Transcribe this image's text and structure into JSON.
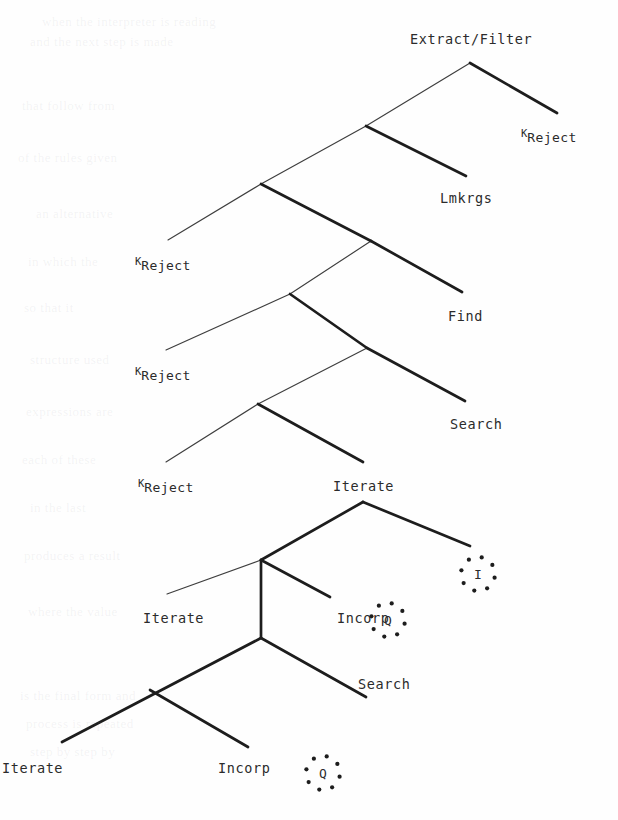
{
  "figure": {
    "type": "derivation-tree",
    "background_color": "#fefefe",
    "stroke_color": "#1d1d1d",
    "text_color": "#2b2b2b",
    "width": 618,
    "height": 820
  },
  "nodes": [
    {
      "id": "root",
      "label": "Extract/Filter",
      "x": 470,
      "y": 63,
      "label_x": 410,
      "label_y": 33
    },
    {
      "id": "n2",
      "label": "",
      "x": 366,
      "y": 126
    },
    {
      "id": "n3",
      "label": "",
      "x": 261,
      "y": 184
    },
    {
      "id": "n4",
      "label": "",
      "x": 371,
      "y": 241
    },
    {
      "id": "n5",
      "label": "",
      "x": 290,
      "y": 294
    },
    {
      "id": "n6",
      "label": "",
      "x": 367,
      "y": 348
    },
    {
      "id": "n7",
      "label": "",
      "x": 258,
      "y": 404
    },
    {
      "id": "iterate_top",
      "label": "Iterate",
      "x": 363,
      "y": 502,
      "label_x": 333,
      "label_y": 480
    },
    {
      "id": "n9",
      "label": "",
      "x": 261,
      "y": 560
    },
    {
      "id": "n10",
      "label": "",
      "x": 261,
      "y": 638
    }
  ],
  "leaves": [
    {
      "id": "leaf-reject-1",
      "label": "Reject",
      "sup": "K",
      "x": 521,
      "y": 128,
      "tip_x": 557,
      "tip_y": 113
    },
    {
      "id": "leaf-lmkrgs",
      "label": "Lmkrgs",
      "x": 440,
      "y": 192,
      "tip_x": 466,
      "tip_y": 176
    },
    {
      "id": "leaf-reject-2",
      "label": "Reject",
      "sup": "K",
      "x": 135,
      "y": 256,
      "tip_x": 168,
      "tip_y": 240
    },
    {
      "id": "leaf-find",
      "label": "Find",
      "x": 448,
      "y": 310,
      "tip_x": 462,
      "tip_y": 292
    },
    {
      "id": "leaf-reject-3",
      "label": "Reject",
      "sup": "K",
      "x": 135,
      "y": 366,
      "tip_x": 166,
      "tip_y": 350
    },
    {
      "id": "leaf-search-1",
      "label": "Search",
      "x": 450,
      "y": 418,
      "tip_x": 465,
      "tip_y": 401
    },
    {
      "id": "leaf-reject-4",
      "label": "Reject",
      "sup": "K",
      "x": 138,
      "y": 478,
      "tip_x": 166,
      "tip_y": 462
    },
    {
      "id": "leaf-iterate-2",
      "label": "Iterate",
      "x": 143,
      "y": 612,
      "tip_x": 167,
      "tip_y": 594
    },
    {
      "id": "leaf-incorp-1",
      "label": "Incorp",
      "x": 337,
      "y": 612,
      "tip_x": 330,
      "tip_y": 597
    },
    {
      "id": "leaf-search-2",
      "label": "Search",
      "x": 358,
      "y": 678,
      "tip_x": 366,
      "tip_y": 663
    },
    {
      "id": "leaf-iterate-3",
      "label": "Iterate",
      "x": 2,
      "y": 762,
      "tip_x": 62,
      "tip_y": 742
    },
    {
      "id": "leaf-incorp-2",
      "label": "Incorp",
      "x": 218,
      "y": 762,
      "tip_x": 248,
      "tip_y": 747
    }
  ],
  "circled_symbols": [
    {
      "id": "circle-i",
      "letter": "I",
      "x": 455,
      "y": 551
    },
    {
      "id": "circle-q1",
      "letter": "Q",
      "x": 365,
      "y": 597
    },
    {
      "id": "circle-q2",
      "letter": "Q",
      "x": 300,
      "y": 750
    }
  ],
  "edges": [
    {
      "from": "root",
      "to": "n2",
      "weight": "thin",
      "x1": 470,
      "y1": 63,
      "x2": 366,
      "y2": 126
    },
    {
      "from": "root",
      "to": "leaf-reject-1",
      "weight": "thick",
      "x1": 470,
      "y1": 63,
      "x2": 557,
      "y2": 113
    },
    {
      "from": "n2",
      "to": "n3",
      "weight": "thin",
      "x1": 366,
      "y1": 126,
      "x2": 261,
      "y2": 184
    },
    {
      "from": "n2",
      "to": "leaf-lmkrgs",
      "weight": "thick",
      "x1": 366,
      "y1": 126,
      "x2": 466,
      "y2": 176
    },
    {
      "from": "n3",
      "to": "leaf-reject-2",
      "weight": "thin",
      "x1": 261,
      "y1": 184,
      "x2": 168,
      "y2": 240
    },
    {
      "from": "n3",
      "to": "n4",
      "weight": "thick",
      "x1": 261,
      "y1": 184,
      "x2": 371,
      "y2": 241
    },
    {
      "from": "n4",
      "to": "n5",
      "weight": "thin",
      "x1": 371,
      "y1": 241,
      "x2": 290,
      "y2": 294
    },
    {
      "from": "n4",
      "to": "leaf-find",
      "weight": "thick",
      "x1": 371,
      "y1": 241,
      "x2": 462,
      "y2": 292
    },
    {
      "from": "n5",
      "to": "leaf-reject-3",
      "weight": "thin",
      "x1": 290,
      "y1": 294,
      "x2": 166,
      "y2": 350
    },
    {
      "from": "n5",
      "to": "n6",
      "weight": "thick",
      "x1": 290,
      "y1": 294,
      "x2": 367,
      "y2": 348
    },
    {
      "from": "n6",
      "to": "n7",
      "weight": "thin",
      "x1": 367,
      "y1": 348,
      "x2": 258,
      "y2": 404
    },
    {
      "from": "n6",
      "to": "leaf-search-1",
      "weight": "thick",
      "x1": 367,
      "y1": 348,
      "x2": 465,
      "y2": 401
    },
    {
      "from": "n7",
      "to": "leaf-reject-4",
      "weight": "thin",
      "x1": 258,
      "y1": 404,
      "x2": 166,
      "y2": 462
    },
    {
      "from": "n7",
      "to": "iterate_top",
      "weight": "thick",
      "x1": 258,
      "y1": 404,
      "x2": 363,
      "y2": 462
    },
    {
      "from": "iterate_top",
      "to": "n9",
      "weight": "thick",
      "x1": 363,
      "y1": 502,
      "x2": 261,
      "y2": 560
    },
    {
      "from": "iterate_top",
      "to": "circle-i",
      "weight": "thick",
      "x1": 363,
      "y1": 502,
      "x2": 470,
      "y2": 546
    },
    {
      "from": "n9",
      "to": "leaf-iterate-2",
      "weight": "thin",
      "x1": 261,
      "y1": 560,
      "x2": 167,
      "y2": 594
    },
    {
      "from": "n9",
      "to": "n10",
      "weight": "thick",
      "x1": 261,
      "y1": 560,
      "x2": 261,
      "y2": 638
    },
    {
      "from": "n9",
      "to": "leaf-incorp-1",
      "weight": "thick",
      "x1": 261,
      "y1": 560,
      "x2": 330,
      "y2": 597
    },
    {
      "from": "n10",
      "to": "leaf-iterate-3",
      "weight": "thick",
      "x1": 261,
      "y1": 638,
      "x2": 62,
      "y2": 742
    },
    {
      "from": "n10",
      "to": "leaf-search-2",
      "weight": "thick",
      "x1": 261,
      "y1": 638,
      "x2": 366,
      "y2": 697
    },
    {
      "from": "n10b",
      "to": "leaf-incorp-2",
      "weight": "thick",
      "x1": 150,
      "y1": 690,
      "x2": 248,
      "y2": 747
    }
  ],
  "ghost_lines": [
    {
      "text": "when the interpreter is reading",
      "x": 42,
      "y": 14
    },
    {
      "text": "and the next step is made",
      "x": 30,
      "y": 34
    },
    {
      "text": "that follow from",
      "x": 22,
      "y": 98
    },
    {
      "text": "of the rules given",
      "x": 18,
      "y": 150
    },
    {
      "text": "an alternative",
      "x": 36,
      "y": 206
    },
    {
      "text": "in which the",
      "x": 28,
      "y": 254
    },
    {
      "text": "so that it",
      "x": 24,
      "y": 300
    },
    {
      "text": "structure used",
      "x": 30,
      "y": 352
    },
    {
      "text": "expressions are",
      "x": 26,
      "y": 404
    },
    {
      "text": "each of these",
      "x": 22,
      "y": 452
    },
    {
      "text": "in the last",
      "x": 30,
      "y": 500
    },
    {
      "text": "produces a result",
      "x": 24,
      "y": 548
    },
    {
      "text": "where the value",
      "x": 28,
      "y": 604
    },
    {
      "text": "is the final form and",
      "x": 20,
      "y": 688
    },
    {
      "text": "process is repeated",
      "x": 26,
      "y": 716
    },
    {
      "text": "step by step by",
      "x": 30,
      "y": 744
    }
  ]
}
